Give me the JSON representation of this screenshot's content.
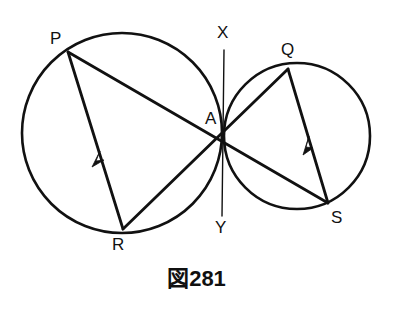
{
  "figure": {
    "caption": "図281",
    "background_color": "#ffffff",
    "stroke_color": "#111111",
    "canvas": {
      "width": 393,
      "height": 311
    }
  },
  "geometry": {
    "circles": [
      {
        "name": "left-circle",
        "cx": 122,
        "cy": 133,
        "r": 100,
        "stroke_width": 2.6
      },
      {
        "name": "right-circle",
        "cx": 297,
        "cy": 136,
        "r": 73,
        "stroke_width": 2.6
      }
    ],
    "points": [
      {
        "id": "P",
        "label": "P",
        "x": 68,
        "y": 52,
        "label_x": 50,
        "label_y": 30
      },
      {
        "id": "Q",
        "label": "Q",
        "x": 288,
        "y": 69,
        "label_x": 281,
        "label_y": 41
      },
      {
        "id": "R",
        "label": "R",
        "x": 123,
        "y": 229,
        "label_x": 112,
        "label_y": 236
      },
      {
        "id": "S",
        "label": "S",
        "x": 328,
        "y": 203,
        "label_x": 331,
        "label_y": 209
      },
      {
        "id": "A",
        "label": "A",
        "x": 222,
        "y": 137,
        "label_x": 205,
        "label_y": 110
      },
      {
        "id": "X",
        "label": "X",
        "x": 224,
        "y": 50,
        "label_x": 217,
        "label_y": 24
      },
      {
        "id": "Y",
        "label": "Y",
        "x": 222,
        "y": 216,
        "label_x": 215,
        "label_y": 219
      }
    ],
    "segments": [
      {
        "name": "segment-P-S",
        "from": "P",
        "to": "S",
        "stroke_width": 2.8,
        "arrow": false
      },
      {
        "name": "segment-P-R",
        "from": "P",
        "to": "R",
        "stroke_width": 2.8,
        "arrow": true,
        "arrow_t": 0.57
      },
      {
        "name": "segment-Q-S",
        "from": "Q",
        "to": "S",
        "stroke_width": 2.8,
        "arrow": true,
        "arrow_t": 0.53
      },
      {
        "name": "segment-Q-R",
        "from": "Q",
        "to": "R",
        "stroke_width": 2.8,
        "arrow": false
      },
      {
        "name": "segment-X-Y",
        "from": "X",
        "to": "Y",
        "stroke_width": 1.4,
        "arrow": false
      }
    ],
    "labels_note": "A is the tangency/intersection point where the two circles touch; XY is the common tangent line through A."
  }
}
